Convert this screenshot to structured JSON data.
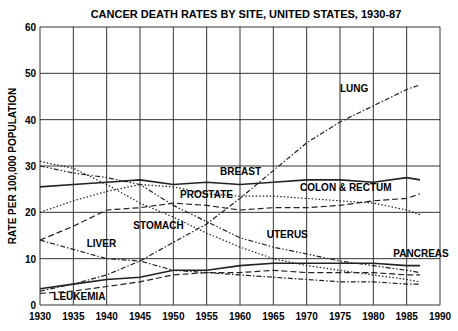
{
  "chart_data": {
    "type": "line",
    "title": "CANCER DEATH RATES BY SITE, UNITED STATES, 1930-87",
    "xlabel": "",
    "ylabel": "RATE PER 100,000 POPULATION",
    "xlim": [
      1930,
      1990
    ],
    "ylim": [
      0,
      60
    ],
    "x_ticks": [
      "1930",
      "1935",
      "1940",
      "1945",
      "1950",
      "1955",
      "1960",
      "1965",
      "1970",
      "1975",
      "1980",
      "1985",
      "1990"
    ],
    "y_ticks": [
      "0",
      "10",
      "20",
      "30",
      "40",
      "50",
      "60"
    ],
    "grid": true,
    "x": [
      1930,
      1935,
      1940,
      1945,
      1950,
      1955,
      1960,
      1965,
      1970,
      1975,
      1980,
      1985,
      1987
    ],
    "series": [
      {
        "name": "LUNG",
        "style": "dash-dot",
        "values": [
          3.0,
          4.5,
          6.5,
          9.5,
          13.5,
          17.5,
          23.0,
          29.0,
          35.0,
          39.5,
          43.0,
          46.5,
          47.5
        ]
      },
      {
        "name": "BREAST",
        "style": "solid",
        "values": [
          25.5,
          26.0,
          26.5,
          27.0,
          26.0,
          26.5,
          26.0,
          26.5,
          27.0,
          27.0,
          26.5,
          27.5,
          27.0
        ]
      },
      {
        "name": "COLON & RECTUM",
        "style": "dotted",
        "values": [
          20.0,
          22.5,
          24.5,
          26.0,
          25.5,
          24.0,
          23.5,
          23.5,
          23.0,
          22.5,
          22.0,
          20.5,
          19.5
        ]
      },
      {
        "name": "PROSTATE",
        "style": "dashed",
        "values": [
          14.0,
          17.0,
          20.5,
          21.0,
          22.0,
          21.5,
          20.5,
          21.0,
          21.0,
          21.5,
          22.5,
          23.0,
          24.0
        ]
      },
      {
        "name": "STOMACH",
        "style": "dotted",
        "values": [
          31.0,
          29.5,
          26.0,
          22.0,
          19.0,
          15.5,
          12.5,
          10.0,
          8.5,
          7.5,
          6.5,
          5.5,
          5.0
        ]
      },
      {
        "name": "UTERUS",
        "style": "dash-dot-dot",
        "values": [
          30.0,
          28.5,
          27.5,
          26.0,
          21.5,
          18.0,
          14.5,
          12.5,
          11.0,
          9.5,
          8.5,
          7.5,
          7.0
        ]
      },
      {
        "name": "LIVER",
        "style": "dash-dot",
        "values": [
          14.0,
          12.0,
          10.0,
          9.5,
          7.5,
          7.0,
          6.5,
          6.0,
          5.5,
          5.0,
          5.0,
          4.5,
          4.5
        ]
      },
      {
        "name": "PANCREAS",
        "style": "solid",
        "values": [
          3.5,
          4.5,
          5.5,
          6.0,
          7.5,
          7.5,
          8.5,
          9.0,
          9.0,
          9.0,
          9.0,
          8.5,
          8.5
        ]
      },
      {
        "name": "LEUKEMIA",
        "style": "dashed",
        "values": [
          2.5,
          3.0,
          4.0,
          5.0,
          6.5,
          7.0,
          7.0,
          7.5,
          7.0,
          7.0,
          7.0,
          6.5,
          6.5
        ]
      }
    ],
    "annotations": [
      {
        "text": "LUNG",
        "x": 1975,
        "y": 46
      },
      {
        "text": "BREAST",
        "x": 1957,
        "y": 28
      },
      {
        "text": "COLON & RECTUM",
        "x": 1969,
        "y": 24.5
      },
      {
        "text": "PROSTATE",
        "x": 1951,
        "y": 23
      },
      {
        "text": "STOMACH",
        "x": 1944,
        "y": 16.5
      },
      {
        "text": "UTERUS",
        "x": 1964,
        "y": 14.5
      },
      {
        "text": "LIVER",
        "x": 1937,
        "y": 12.5
      },
      {
        "text": "PANCREAS",
        "x": 1983,
        "y": 10.3
      },
      {
        "text": "LEUKEMIA",
        "x": 1932,
        "y": 1
      }
    ]
  }
}
